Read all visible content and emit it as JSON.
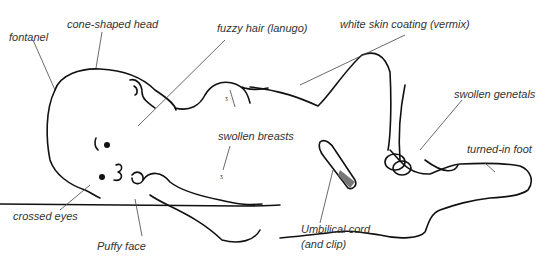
{
  "diagram": {
    "labels": {
      "fontanel": "fontanel",
      "cone_head": "cone-shaped head",
      "lanugo": "fuzzy hair (lanugo)",
      "vermix": "white skin coating (vermix)",
      "genetals": "swollen genetals",
      "breasts": "swollen breasts",
      "foot": "turned-in foot",
      "eyes": "crossed eyes",
      "face": "Puffy face",
      "cord_line1": "Umbilical cord",
      "cord_line2": "(and clip)"
    }
  }
}
